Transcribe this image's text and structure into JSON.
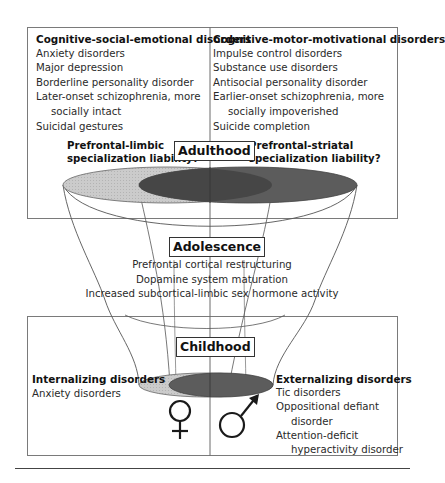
{
  "diagram": {
    "adulthood": {
      "stage_label": "Adulthood",
      "left_box": {
        "heading": "Cognitive-social-emotional disorders",
        "items": [
          "Anxiety disorders",
          "Major depression",
          "Borderline personality disorder",
          "Later-onset schizophrenia, more",
          "socially intact",
          "Suicidal gestures"
        ]
      },
      "right_box": {
        "heading": "Cognitive-motor-motivational disorders",
        "items": [
          "Impulse control disorders",
          "Substance use disorders",
          "Antisocial personality disorder",
          "Earlier-onset schizophrenia, more",
          "socially impoverished",
          "Suicide completion"
        ]
      },
      "left_liability": [
        "Prefrontal-limbic",
        "specialization liability?"
      ],
      "right_liability": [
        "Prefrontal-striatal",
        "specialization liability?"
      ]
    },
    "adolescence": {
      "stage_label": "Adolescence",
      "processes": [
        "Prefrontal cortical restructuring",
        "Dopamine system maturation",
        "Increased subcortical-limbic sex hormone activity"
      ]
    },
    "childhood": {
      "stage_label": "Childhood",
      "left_box": {
        "heading": "Internalizing disorders",
        "items": [
          "Anxiety disorders"
        ]
      },
      "right_box": {
        "heading": "Externalizing disorders",
        "items": [
          "Tic disorders",
          "Oppositional defiant",
          "disorder",
          "Attention-deficit",
          "hyperactivity disorder"
        ]
      },
      "symbols": {
        "left": "female-symbol",
        "right": "male-symbol"
      }
    },
    "colors": {
      "light_ellipse": "#c4c4c4",
      "dark_ellipse": "#5e5e5e",
      "overlap": "#4a4a4a",
      "lines": "#555555",
      "box_border": "#777777"
    }
  }
}
